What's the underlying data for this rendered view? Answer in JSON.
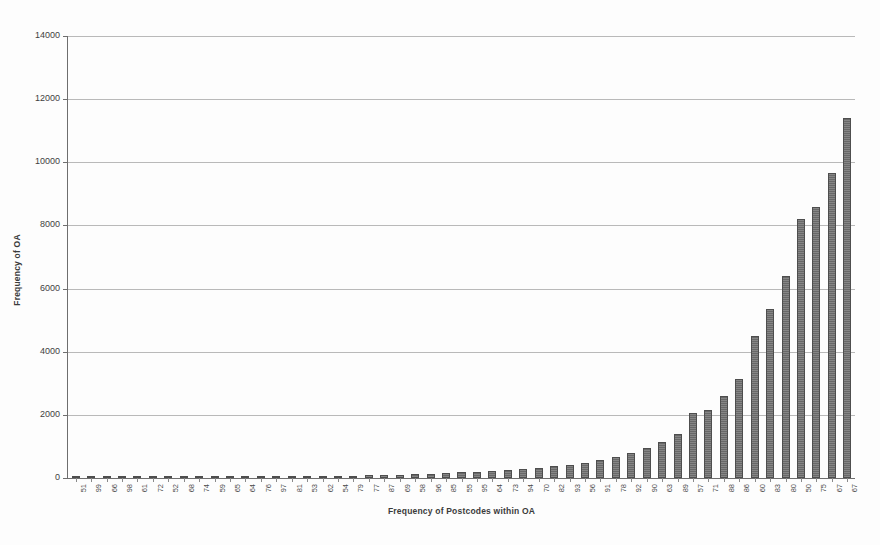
{
  "chart_data": {
    "type": "bar",
    "title": "",
    "xlabel": "Frequency of Postcodes within OA",
    "ylabel": "Frequency of OA",
    "ylim": [
      0,
      14000
    ],
    "ytick_step": 2000,
    "yticks": [
      0,
      2000,
      4000,
      6000,
      8000,
      10000,
      12000,
      14000
    ],
    "ytick_labels": [
      "0",
      "2000",
      "4000",
      "6000",
      "8000",
      "10000",
      "12000",
      "14000"
    ],
    "grid": "horizontal",
    "legend": "none",
    "bar_color": "#6f6f6f",
    "bar_edge_color": "#4e4e4e",
    "gridline_color": "#b9b9b9",
    "axis_color": "#6e6e6e",
    "xtick_rotation": -90,
    "categories": [
      "51",
      "99",
      "66",
      "98",
      "61",
      "72",
      "52",
      "68",
      "74",
      "59",
      "65",
      "64",
      "76",
      "97",
      "81",
      "53",
      "62",
      "54",
      "79",
      "77",
      "87",
      "69",
      "58",
      "96",
      "85",
      "55",
      "95",
      "64",
      "73",
      "94",
      "70",
      "82",
      "93",
      "56",
      "91",
      "78",
      "92",
      "90",
      "63",
      "89",
      "57",
      "71",
      "88",
      "86",
      "60",
      "83",
      "80",
      "50",
      "75",
      "67"
    ],
    "values": [
      2,
      3,
      4,
      5,
      6,
      8,
      10,
      12,
      14,
      17,
      20,
      24,
      28,
      33,
      38,
      45,
      52,
      60,
      70,
      80,
      92,
      105,
      120,
      138,
      158,
      180,
      205,
      232,
      262,
      295,
      330,
      370,
      420,
      480,
      560,
      660,
      790,
      950,
      1150,
      1400,
      2050,
      2150,
      2600,
      3150,
      4500,
      5350,
      6400,
      8200,
      8600,
      9650
    ],
    "max_value": 11400,
    "value_axis_max_bar": "67"
  },
  "chart": {
    "y_axis_title": "Frequency of OA",
    "x_axis_title": "Frequency of Postcodes within OA"
  }
}
